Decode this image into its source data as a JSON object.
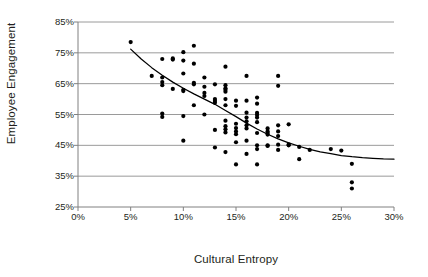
{
  "chart_data": {
    "type": "scatter",
    "title": "",
    "xlabel": "Cultural Entropy",
    "ylabel": "Employee Engagement",
    "xlim": [
      0,
      30
    ],
    "ylim": [
      25,
      85
    ],
    "xticks": [
      "0%",
      "5%",
      "10%",
      "15%",
      "20%",
      "25%",
      "30%"
    ],
    "xtick_values": [
      0,
      5,
      10,
      15,
      20,
      25,
      30
    ],
    "yticks": [
      "25%",
      "35%",
      "45%",
      "55%",
      "65%",
      "75%",
      "85%"
    ],
    "ytick_values": [
      25,
      35,
      45,
      55,
      65,
      75,
      85
    ],
    "grid": "horizontal",
    "legend": "none",
    "marker_color": "#000000",
    "grid_color": "#9a9a9a",
    "axis_color": "#808080",
    "trendline": {
      "label": "",
      "color": "#000000",
      "points": [
        [
          5.0,
          76.2
        ],
        [
          6.0,
          73.0
        ],
        [
          7.0,
          70.2
        ],
        [
          8.0,
          67.7
        ],
        [
          9.0,
          65.5
        ],
        [
          10.0,
          63.5
        ],
        [
          11.0,
          61.7
        ],
        [
          12.0,
          60.0
        ],
        [
          13.0,
          58.3
        ],
        [
          14.0,
          56.3
        ],
        [
          15.0,
          54.3
        ],
        [
          16.0,
          52.2
        ],
        [
          17.0,
          50.3
        ],
        [
          18.0,
          48.6
        ],
        [
          19.0,
          47.1
        ],
        [
          20.0,
          45.8
        ],
        [
          21.0,
          44.7
        ],
        [
          22.0,
          43.7
        ],
        [
          23.0,
          42.9
        ],
        [
          24.0,
          42.3
        ],
        [
          25.0,
          41.7
        ],
        [
          26.0,
          41.3
        ],
        [
          27.0,
          41.0
        ],
        [
          28.0,
          40.8
        ],
        [
          29.0,
          40.6
        ],
        [
          30.0,
          40.5
        ]
      ]
    },
    "points": [
      [
        5.0,
        78.5
      ],
      [
        7.0,
        67.5
      ],
      [
        8.0,
        73.0
      ],
      [
        8.0,
        67.0
      ],
      [
        8.0,
        65.5
      ],
      [
        8.0,
        64.5
      ],
      [
        8.0,
        55.3
      ],
      [
        8.0,
        54.2
      ],
      [
        9.0,
        73.2
      ],
      [
        9.0,
        72.8
      ],
      [
        9.0,
        63.3
      ],
      [
        10.0,
        75.2
      ],
      [
        10.0,
        72.5
      ],
      [
        10.0,
        68.3
      ],
      [
        10.0,
        63.0
      ],
      [
        10.0,
        62.6
      ],
      [
        10.0,
        54.5
      ],
      [
        10.0,
        46.5
      ],
      [
        11.0,
        77.3
      ],
      [
        11.0,
        71.5
      ],
      [
        11.0,
        65.3
      ],
      [
        11.0,
        64.8
      ],
      [
        11.0,
        58.0
      ],
      [
        12.0,
        67.0
      ],
      [
        12.0,
        64.0
      ],
      [
        12.0,
        62.0
      ],
      [
        12.0,
        61.0
      ],
      [
        12.0,
        55.0
      ],
      [
        13.0,
        64.8
      ],
      [
        13.0,
        60.0
      ],
      [
        13.0,
        59.4
      ],
      [
        13.0,
        58.8
      ],
      [
        13.0,
        50.0
      ],
      [
        13.0,
        44.3
      ],
      [
        14.0,
        70.5
      ],
      [
        14.0,
        64.5
      ],
      [
        14.0,
        63.5
      ],
      [
        14.0,
        63.0
      ],
      [
        14.0,
        62.4
      ],
      [
        14.0,
        60.0
      ],
      [
        14.0,
        58.0
      ],
      [
        14.0,
        53.0
      ],
      [
        14.0,
        51.2
      ],
      [
        14.0,
        50.2
      ],
      [
        14.0,
        49.2
      ],
      [
        14.0,
        42.8
      ],
      [
        15.0,
        59.5
      ],
      [
        15.0,
        57.8
      ],
      [
        15.0,
        52.0
      ],
      [
        15.0,
        50.6
      ],
      [
        15.0,
        49.5
      ],
      [
        15.0,
        48.6
      ],
      [
        15.0,
        46.0
      ],
      [
        15.0,
        38.8
      ],
      [
        16.0,
        67.5
      ],
      [
        16.0,
        59.5
      ],
      [
        16.0,
        55.6
      ],
      [
        16.0,
        54.0
      ],
      [
        16.0,
        52.8
      ],
      [
        16.0,
        51.5
      ],
      [
        16.0,
        50.5
      ],
      [
        16.0,
        46.5
      ],
      [
        16.0,
        42.2
      ],
      [
        17.0,
        60.5
      ],
      [
        17.0,
        58.5
      ],
      [
        17.0,
        55.5
      ],
      [
        17.0,
        54.8
      ],
      [
        17.0,
        54.0
      ],
      [
        17.0,
        52.5
      ],
      [
        17.0,
        49.0
      ],
      [
        17.0,
        45.0
      ],
      [
        17.0,
        43.8
      ],
      [
        17.0,
        38.8
      ],
      [
        18.0,
        50.5
      ],
      [
        18.0,
        49.5
      ],
      [
        18.0,
        49.0
      ],
      [
        18.0,
        48.5
      ],
      [
        18.0,
        45.0
      ],
      [
        18.0,
        44.8
      ],
      [
        19.0,
        67.5
      ],
      [
        19.0,
        64.3
      ],
      [
        19.0,
        51.5
      ],
      [
        19.0,
        49.5
      ],
      [
        19.0,
        48.0
      ],
      [
        19.0,
        45.2
      ],
      [
        19.0,
        43.5
      ],
      [
        20.0,
        51.8
      ],
      [
        20.0,
        45.3
      ],
      [
        20.0,
        45.0
      ],
      [
        21.0,
        44.5
      ],
      [
        21.0,
        40.5
      ],
      [
        22.0,
        43.5
      ],
      [
        24.0,
        43.8
      ],
      [
        25.0,
        43.3
      ],
      [
        26.0,
        39.0
      ],
      [
        26.0,
        33.0
      ],
      [
        26.0,
        31.0
      ]
    ]
  }
}
